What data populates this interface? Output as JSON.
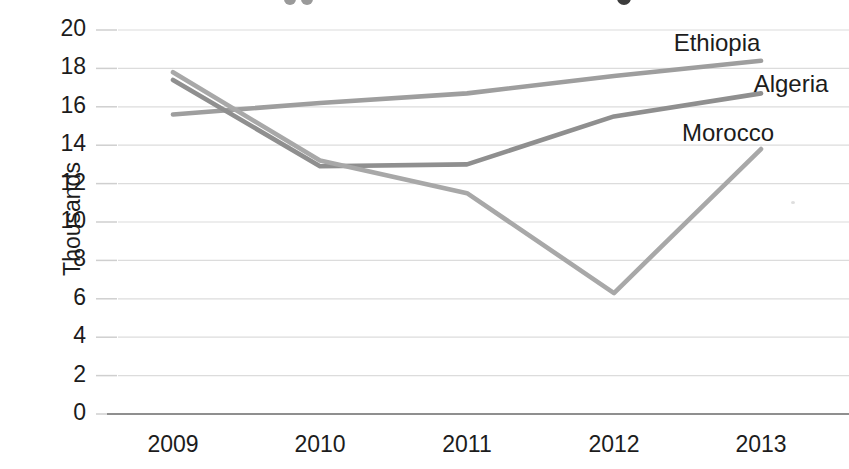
{
  "chart_data": {
    "type": "line",
    "ylabel": "Thousands",
    "x_labels": [
      "2009",
      "2010",
      "2011",
      "2012",
      "2013"
    ],
    "y_ticks": [
      0,
      2,
      4,
      6,
      8,
      10,
      12,
      14,
      16,
      18,
      20
    ],
    "ylim": [
      0,
      20
    ],
    "grid": "horizontal",
    "legend_position": "inline-right-labels",
    "gridline_color": "#dcdcdc",
    "tick_color": "#cfcfcf",
    "axis_color": "#8f8f8f",
    "text_color": "#1c1c1c",
    "series": [
      {
        "name": "Ethiopia",
        "color": "#9e9e9e",
        "values": [
          15.6,
          16.2,
          16.7,
          17.6,
          18.4
        ],
        "label_pos": {
          "x": 717,
          "y": 43
        }
      },
      {
        "name": "Algeria",
        "color": "#8f8f8f",
        "values": [
          17.4,
          12.9,
          13.0,
          15.5,
          16.7
        ],
        "label_pos": {
          "x": 791,
          "y": 84
        }
      },
      {
        "name": "Morocco",
        "color": "#a8a8a8",
        "values": [
          17.8,
          13.2,
          11.5,
          6.3,
          13.8
        ],
        "label_pos": {
          "x": 728,
          "y": 133
        }
      }
    ]
  }
}
